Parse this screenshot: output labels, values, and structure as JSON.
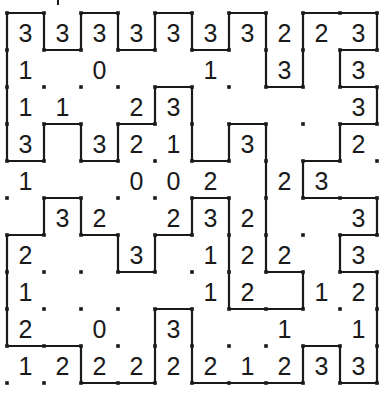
{
  "puzzle": {
    "type": "slitherlink",
    "rows": 10,
    "cols": 10,
    "origin": {
      "x": 7,
      "y": 13
    },
    "cell_size": 37,
    "colors": {
      "ink": "#1a1a1a",
      "background": "#ffffff"
    },
    "clues": [
      [
        "3",
        "3",
        "3",
        "3",
        "3",
        "3",
        "3",
        "2",
        "2",
        "3"
      ],
      [
        "1",
        "",
        "0",
        "",
        "",
        "1",
        "",
        "3",
        "",
        "3"
      ],
      [
        "1",
        "1",
        "",
        "2",
        "3",
        "",
        "",
        "",
        "",
        "3"
      ],
      [
        "3",
        "",
        "3",
        "2",
        "1",
        "",
        "3",
        "",
        "",
        "2"
      ],
      [
        "1",
        "",
        "",
        "0",
        "0",
        "2",
        "",
        "2",
        "3",
        ""
      ],
      [
        "",
        "3",
        "2",
        "",
        "2",
        "3",
        "2",
        "",
        "",
        "3"
      ],
      [
        "2",
        "",
        "",
        "3",
        "",
        "1",
        "2",
        "2",
        "",
        "3"
      ],
      [
        "1",
        "",
        "",
        "",
        "",
        "1",
        "2",
        "",
        "1",
        "2"
      ],
      [
        "2",
        "",
        "0",
        "",
        "3",
        "",
        "",
        "1",
        "",
        "1"
      ],
      [
        "1",
        "2",
        "2",
        "2",
        "2",
        "2",
        "1",
        "2",
        "3",
        "3"
      ]
    ],
    "loop": [
      [
        0,
        0
      ],
      [
        1,
        0
      ],
      [
        1,
        1
      ],
      [
        2,
        1
      ],
      [
        2,
        0
      ],
      [
        3,
        0
      ],
      [
        3,
        1
      ],
      [
        4,
        1
      ],
      [
        4,
        0
      ],
      [
        5,
        0
      ],
      [
        5,
        1
      ],
      [
        6,
        1
      ],
      [
        6,
        0
      ],
      [
        7,
        0
      ],
      [
        7,
        2
      ],
      [
        8,
        2
      ],
      [
        8,
        0
      ],
      [
        10,
        0
      ],
      [
        10,
        1
      ],
      [
        9,
        1
      ],
      [
        9,
        2
      ],
      [
        10,
        2
      ],
      [
        10,
        3
      ],
      [
        9,
        3
      ],
      [
        9,
        4
      ],
      [
        8,
        4
      ],
      [
        8,
        5
      ],
      [
        10,
        5
      ],
      [
        10,
        6
      ],
      [
        9,
        6
      ],
      [
        9,
        7
      ],
      [
        10,
        7
      ],
      [
        10,
        10
      ],
      [
        9,
        10
      ],
      [
        9,
        9
      ],
      [
        8,
        9
      ],
      [
        8,
        10
      ],
      [
        5,
        10
      ],
      [
        5,
        8
      ],
      [
        4,
        8
      ],
      [
        4,
        10
      ],
      [
        2,
        10
      ],
      [
        2,
        9
      ],
      [
        0,
        9
      ],
      [
        0,
        6
      ],
      [
        1,
        6
      ],
      [
        1,
        5
      ],
      [
        2,
        5
      ],
      [
        2,
        6
      ],
      [
        3,
        6
      ],
      [
        3,
        7
      ],
      [
        4,
        7
      ],
      [
        4,
        6
      ],
      [
        5,
        6
      ],
      [
        5,
        5
      ],
      [
        6,
        5
      ],
      [
        6,
        8
      ],
      [
        8,
        8
      ],
      [
        8,
        7
      ],
      [
        7,
        7
      ],
      [
        7,
        3
      ],
      [
        6,
        3
      ],
      [
        6,
        4
      ],
      [
        5,
        4
      ],
      [
        5,
        2
      ],
      [
        4,
        2
      ],
      [
        4,
        3
      ],
      [
        3,
        3
      ],
      [
        3,
        4
      ],
      [
        2,
        4
      ],
      [
        2,
        3
      ],
      [
        1,
        3
      ],
      [
        1,
        4
      ],
      [
        0,
        4
      ]
    ]
  }
}
